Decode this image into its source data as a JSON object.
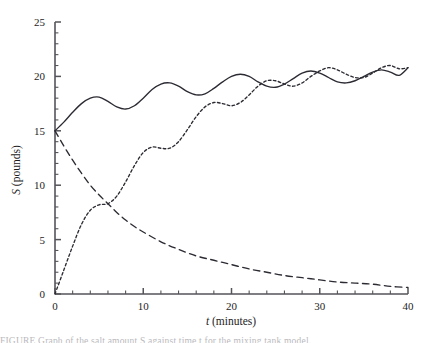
{
  "figure": {
    "background": "#ffffff",
    "ink_color": "#2b2b33",
    "axis_color": "#55545a"
  },
  "axes": {
    "x_title_symbol": "t",
    "x_title_units": " (minutes)",
    "y_title_symbol": "S",
    "y_title_units": " (pounds)",
    "x_ticks": [
      "0",
      "10",
      "20",
      "30",
      "40"
    ],
    "y_ticks": [
      "0",
      "5",
      "10",
      "15",
      "20",
      "25"
    ]
  },
  "caption": {
    "partial_text": "FIGURE  Graph of the salt amount S against time t for the mixing tank model."
  },
  "chart_data": {
    "type": "line",
    "title": "",
    "xlabel": "t (minutes)",
    "ylabel": "S (pounds)",
    "xlim": [
      0,
      40
    ],
    "ylim": [
      0,
      25
    ],
    "xticks": [
      0,
      10,
      20,
      30,
      40
    ],
    "yticks": [
      0,
      5,
      10,
      15,
      20,
      25
    ],
    "x_minor_tick_step": 2,
    "y_minor_tick_step": 1,
    "grid": false,
    "legend": "none",
    "series": [
      {
        "name": "total-solution",
        "style": "solid",
        "description": "Damped-oscillation curve rising from 15 toward a mean of about 20 with wave amplitude near 1.3 and period about 6.3 minutes.",
        "x": [
          0,
          1,
          2,
          3,
          4,
          5,
          6,
          7,
          8,
          9,
          10,
          11,
          12,
          13,
          14,
          15,
          16,
          17,
          18,
          19,
          20,
          21,
          22,
          23,
          24,
          25,
          26,
          27,
          28,
          29,
          30,
          31,
          32,
          33,
          34,
          35,
          36,
          37,
          38,
          39,
          40
        ],
        "y": [
          15.0,
          15.8,
          16.7,
          17.5,
          18.0,
          18.1,
          17.7,
          17.2,
          17.0,
          17.3,
          18.0,
          18.8,
          19.3,
          19.4,
          19.1,
          18.6,
          18.3,
          18.4,
          18.9,
          19.5,
          20.0,
          20.2,
          20.0,
          19.5,
          19.1,
          19.0,
          19.3,
          19.8,
          20.3,
          20.5,
          20.3,
          19.9,
          19.5,
          19.4,
          19.6,
          20.0,
          20.4,
          20.6,
          20.4,
          20.1,
          20.8
        ]
      },
      {
        "name": "transient-decay",
        "style": "long-dashed",
        "description": "Exponential-type decay from 15 at t=0 approaching 0 by t=40.",
        "x": [
          0,
          1,
          2,
          3,
          4,
          5,
          6,
          7,
          8,
          9,
          10,
          12,
          14,
          16,
          18,
          20,
          22,
          24,
          26,
          28,
          30,
          32,
          34,
          36,
          38,
          40
        ],
        "y": [
          15.0,
          13.6,
          12.3,
          11.1,
          10.0,
          9.1,
          8.3,
          7.5,
          6.8,
          6.2,
          5.7,
          4.8,
          4.1,
          3.5,
          3.1,
          2.7,
          2.3,
          2.0,
          1.7,
          1.5,
          1.3,
          1.1,
          1.0,
          0.9,
          0.7,
          0.6
        ]
      },
      {
        "name": "steady-state-oscillation",
        "style": "short-dashed",
        "description": "Oscillatory steady-state curve starting at 0, rising and converging onto the solid curve.",
        "x": [
          0,
          1,
          2,
          3,
          4,
          5,
          6,
          7,
          8,
          9,
          10,
          11,
          12,
          13,
          14,
          15,
          16,
          17,
          18,
          19,
          20,
          21,
          22,
          23,
          24,
          25,
          26,
          27,
          28,
          29,
          30,
          31,
          32,
          33,
          34,
          35,
          36,
          37,
          38,
          39,
          40
        ],
        "y": [
          0.0,
          2.2,
          4.4,
          6.4,
          7.7,
          8.2,
          8.3,
          9.0,
          10.3,
          11.8,
          13.0,
          13.5,
          13.4,
          13.4,
          14.0,
          15.1,
          16.3,
          17.2,
          17.6,
          17.5,
          17.3,
          17.6,
          18.3,
          19.1,
          19.6,
          19.6,
          19.3,
          19.1,
          19.4,
          20.0,
          20.5,
          20.8,
          20.6,
          20.2,
          19.9,
          19.9,
          20.3,
          20.8,
          21.0,
          20.7,
          20.8
        ]
      }
    ],
    "annotations": [
      {
        "text": "curves cross near t = 6, S = 8.3"
      },
      {
        "text": "solid and short-dashed curves merge near t = 34-40"
      }
    ]
  }
}
